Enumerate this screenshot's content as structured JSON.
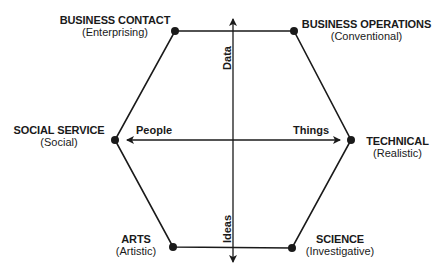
{
  "diagram": {
    "type": "hexagon-career-clusters",
    "nodes": [
      {
        "id": "business_contact",
        "title": "BUSINESS CONTACT",
        "subtitle": "(Enterprising)"
      },
      {
        "id": "business_operations",
        "title": "BUSINESS OPERATIONS",
        "subtitle": "(Conventional)"
      },
      {
        "id": "technical",
        "title": "TECHNICAL",
        "subtitle": "(Realistic)"
      },
      {
        "id": "science",
        "title": "SCIENCE",
        "subtitle": "(Investigative)"
      },
      {
        "id": "arts",
        "title": "ARTS",
        "subtitle": "(Artistic)"
      },
      {
        "id": "social_service",
        "title": "SOCIAL SERVICE",
        "subtitle": "(Social)"
      }
    ],
    "axes": {
      "horizontal": {
        "left": "People",
        "right": "Things"
      },
      "vertical": {
        "top": "Data",
        "bottom": "Ideas"
      }
    },
    "colors": {
      "line": "#1a1a1a",
      "dot": "#1a1a1a",
      "background": "#ffffff"
    }
  }
}
